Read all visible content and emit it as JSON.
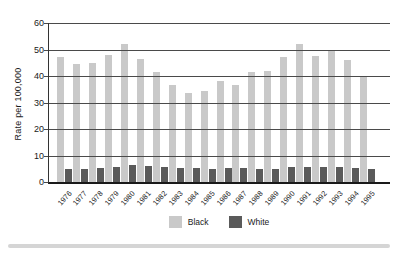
{
  "chart_data": {
    "type": "bar",
    "title": "",
    "xlabel": "",
    "ylabel": "Rate per 100,000",
    "ylim": [
      0,
      60
    ],
    "yticks": [
      60,
      50,
      40,
      30,
      20,
      10,
      0
    ],
    "grid": true,
    "legend_position": "bottom-center",
    "categories": [
      "1976",
      "1977",
      "1978",
      "1979",
      "1980",
      "1981",
      "1982",
      "1983",
      "1984",
      "1985",
      "1986",
      "1987",
      "1988",
      "1989",
      "1990",
      "1991",
      "1992",
      "1993",
      "1994",
      "1995"
    ],
    "series": [
      {
        "name": "Black",
        "color": "#c9c9c9",
        "values": [
          47,
          44.5,
          45,
          48,
          52,
          46.5,
          41.5,
          36.5,
          33.5,
          34.5,
          38,
          36.5,
          41.5,
          42,
          47,
          52,
          47.5,
          50,
          46,
          39.5
        ]
      },
      {
        "name": "White",
        "color": "#5a5a5a",
        "values": [
          4.8,
          5.0,
          5.3,
          5.8,
          6.3,
          6.0,
          5.6,
          5.3,
          5.2,
          5.1,
          5.4,
          5.3,
          5.0,
          5.1,
          5.6,
          5.8,
          5.5,
          5.5,
          5.3,
          5.0
        ]
      }
    ]
  },
  "colors": {
    "background": "#ffffff",
    "gridline": "#4a4a4a",
    "axis": "#1a1a1a",
    "text": "#1a1a1a",
    "divider": "#d5d5d5"
  }
}
